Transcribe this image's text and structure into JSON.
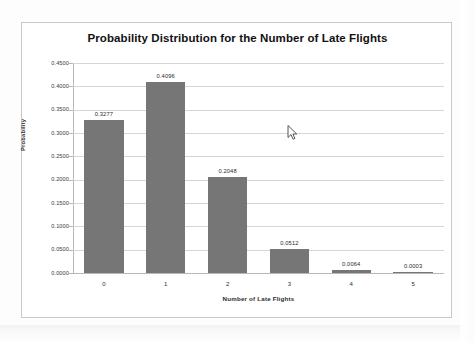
{
  "chart_data": {
    "type": "bar",
    "title": "Probability Distribution for the Number of Late Flights",
    "xlabel": "Number of Late Flights",
    "ylabel": "Probability",
    "categories": [
      "0",
      "1",
      "2",
      "3",
      "4",
      "5"
    ],
    "values": [
      0.3277,
      0.4096,
      0.2048,
      0.0512,
      0.0064,
      0.0003
    ],
    "value_labels": [
      "0.3277",
      "0.4096",
      "0.2048",
      "0.0512",
      "0.0064",
      "0.0003"
    ],
    "ylim": [
      0.0,
      0.45
    ],
    "ytick_labels": [
      "0.4500",
      "0.4000",
      "0.3500",
      "0.3000",
      "0.2500",
      "0.2000",
      "0.1500",
      "0.1000",
      "0.0500",
      "0.0000"
    ],
    "ytick_values": [
      0.45,
      0.4,
      0.35,
      0.3,
      0.25,
      0.2,
      0.15,
      0.1,
      0.05,
      0.0
    ],
    "grid": true,
    "legend": false,
    "series_color": "#767676",
    "gridline_color": "#d6d6d6"
  },
  "cursor": {
    "icon": "mouse-pointer-icon"
  }
}
